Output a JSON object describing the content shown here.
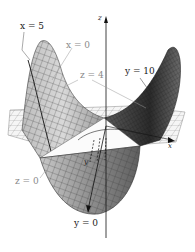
{
  "figure": {
    "labels": {
      "x5": "x = 5",
      "x0": "x = 0",
      "z4": "z = 4",
      "y10": "y = 10",
      "z0": "z = 0",
      "y0": "y = 0"
    },
    "axes": {
      "z": "z",
      "x": "x",
      "y": "y"
    },
    "colors": {
      "surface_light": "#d8d8d8",
      "surface_mid": "#a9a9a9",
      "surface_dark": "#3a3a3a",
      "plane": "#f4f4f4",
      "grid": "#5a5a5a",
      "label_gray": "#8a8a8a",
      "label_dark": "#1a1a1a"
    }
  }
}
